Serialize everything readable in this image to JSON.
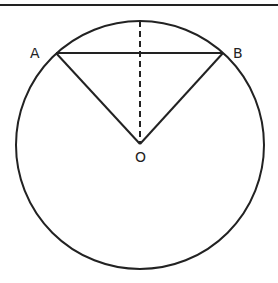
{
  "diagram": {
    "labels": {
      "A": "A",
      "B": "B",
      "O": "O"
    },
    "stroke_color": "#222222",
    "background": "#ffffff",
    "circle": {
      "cx": 140,
      "cy": 145,
      "r": 124
    },
    "points": {
      "A": [
        56,
        53
      ],
      "B": [
        223,
        53
      ],
      "O": [
        140,
        144
      ],
      "top": [
        140,
        21
      ]
    }
  }
}
